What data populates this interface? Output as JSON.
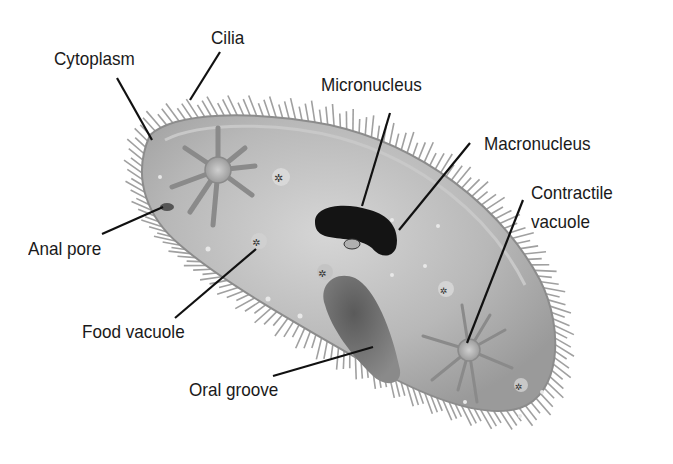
{
  "labels": {
    "cilia": "Cilia",
    "cytoplasm": "Cytoplasm",
    "micronucleus": "Micronucleus",
    "macronucleus": "Macronucleus",
    "contractile_vacuole_line1": "Contractile",
    "contractile_vacuole_line2": "vacuole",
    "anal_pore": "Anal pore",
    "food_vacuole": "Food vacuole",
    "oral_groove": "Oral groove"
  },
  "colors": {
    "body_fill": "#b4b4b4",
    "body_edge": "#8c8c8c",
    "cilia": "#9a9a9a",
    "nucleus": "#141414",
    "oral_groove": "#6a6a6a",
    "leader_line": "#111111",
    "text": "#1a1a1a"
  }
}
